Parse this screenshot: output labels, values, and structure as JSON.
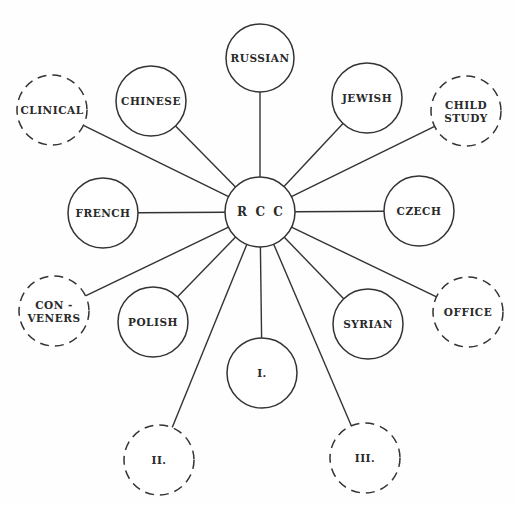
{
  "diagram": {
    "center": {
      "id": "rcc",
      "label": "R  C  C",
      "x": 260,
      "y": 212,
      "r": 35
    },
    "colors": {
      "stroke": "#333333",
      "text": "#2a2a2a",
      "background": "#fefefe"
    },
    "nodes": [
      {
        "id": "russian",
        "lines": [
          "RUSSIAN"
        ],
        "x": 260,
        "y": 58,
        "r": 34,
        "dashed": false
      },
      {
        "id": "chinese",
        "lines": [
          "CHINESE"
        ],
        "x": 151,
        "y": 101,
        "r": 35,
        "dashed": false
      },
      {
        "id": "jewish",
        "lines": [
          "JEWISH"
        ],
        "x": 367,
        "y": 98,
        "r": 35,
        "dashed": false
      },
      {
        "id": "clinical",
        "lines": [
          "CLINICAL"
        ],
        "x": 52,
        "y": 110,
        "r": 35,
        "dashed": true
      },
      {
        "id": "child-study",
        "lines": [
          "CHILD",
          "STUDY"
        ],
        "x": 466,
        "y": 111,
        "r": 35,
        "dashed": true
      },
      {
        "id": "french",
        "lines": [
          "FRENCH"
        ],
        "x": 103,
        "y": 213,
        "r": 35,
        "dashed": false
      },
      {
        "id": "czech",
        "lines": [
          "CZECH"
        ],
        "x": 419,
        "y": 211,
        "r": 35,
        "dashed": false
      },
      {
        "id": "conveners",
        "lines": [
          "CON -",
          "VENERS"
        ],
        "x": 54,
        "y": 311,
        "r": 35,
        "dashed": true
      },
      {
        "id": "polish",
        "lines": [
          "POLISH"
        ],
        "x": 153,
        "y": 322,
        "r": 35,
        "dashed": false
      },
      {
        "id": "syrian",
        "lines": [
          "SYRIAN"
        ],
        "x": 368,
        "y": 324,
        "r": 35,
        "dashed": false
      },
      {
        "id": "office",
        "lines": [
          "OFFICE"
        ],
        "x": 468,
        "y": 312,
        "r": 35,
        "dashed": true
      },
      {
        "id": "group-i",
        "lines": [
          "I."
        ],
        "x": 262,
        "y": 373,
        "r": 35,
        "dashed": false
      },
      {
        "id": "group-ii",
        "lines": [
          "II."
        ],
        "x": 159,
        "y": 460,
        "r": 35,
        "dashed": true
      },
      {
        "id": "group-iii",
        "lines": [
          "III."
        ],
        "x": 365,
        "y": 458,
        "r": 35,
        "dashed": true
      }
    ]
  }
}
